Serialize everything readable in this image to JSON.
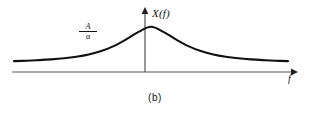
{
  "figure": {
    "caption": "(b)",
    "y_axis_label": "X(f)",
    "x_axis_label": "f",
    "peak_label_numerator": "A",
    "peak_label_denominator": "α",
    "line_color": "#111111",
    "axis_color": "#555555",
    "background_color": "#ffffff"
  },
  "chart_data": {
    "type": "line",
    "title": "(b)",
    "xlabel": "f",
    "ylabel": "X(f)",
    "annotations": [
      {
        "text": "A/α",
        "x": -1.35,
        "y": 0.62,
        "note": "peak amplitude value of the spectrum, A over alpha"
      }
    ],
    "legend": null,
    "grid": false,
    "xlim": [
      -3.3,
      3.3
    ],
    "ylim": [
      0,
      1.12
    ],
    "series": [
      {
        "name": "X(f)",
        "description": "Lorentzian magnitude spectrum, X(f) = (A/alpha) / (1 + (2*pi*f/alpha)^2), even-symmetric about f = 0",
        "x": [
          -3.3,
          -3.0,
          -2.7,
          -2.4,
          -2.1,
          -1.8,
          -1.5,
          -1.2,
          -0.9,
          -0.6,
          -0.3,
          0.0,
          0.3,
          0.6,
          0.9,
          1.2,
          1.5,
          1.8,
          2.1,
          2.4,
          2.7,
          3.0,
          3.3
        ],
        "y": [
          0.155,
          0.165,
          0.179,
          0.198,
          0.224,
          0.262,
          0.318,
          0.402,
          0.525,
          0.69,
          0.875,
          1.0,
          0.875,
          0.69,
          0.525,
          0.402,
          0.318,
          0.262,
          0.224,
          0.198,
          0.179,
          0.165,
          0.155
        ]
      }
    ],
    "axes": {
      "x_axis_arrow": true,
      "y_axis_arrow": true,
      "x_axis_position_y": 0,
      "y_axis_position_x": 0,
      "ticks": []
    }
  }
}
